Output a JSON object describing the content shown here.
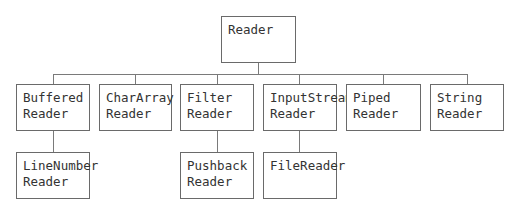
{
  "diagram": {
    "root": {
      "id": "reader",
      "label": "Reader"
    },
    "children": [
      {
        "id": "buffered",
        "label": "Buffered\nReader",
        "children": [
          {
            "id": "linenumber",
            "label": "LineNumber\nReader"
          }
        ]
      },
      {
        "id": "chararray",
        "label": "CharArray\nReader",
        "children": []
      },
      {
        "id": "filter",
        "label": "Filter\nReader",
        "children": [
          {
            "id": "pushback",
            "label": "Pushback\nReader"
          }
        ]
      },
      {
        "id": "inputstream",
        "label": "InputStream\nReader",
        "children": [
          {
            "id": "filereader",
            "label": "FileReader"
          }
        ]
      },
      {
        "id": "piped",
        "label": "Piped\nReader",
        "children": []
      },
      {
        "id": "string",
        "label": "String\nReader",
        "children": []
      }
    ]
  },
  "labels": {
    "reader": "Reader",
    "buffered": "Buffered\nReader",
    "chararray": "CharArray\nReader",
    "filter": "Filter\nReader",
    "inputstream": "InputStream\nReader",
    "piped": "Piped\nReader",
    "string": "String\nReader",
    "linenumber": "LineNumber\nReader",
    "pushback": "Pushback\nReader",
    "filereader": "FileReader"
  }
}
